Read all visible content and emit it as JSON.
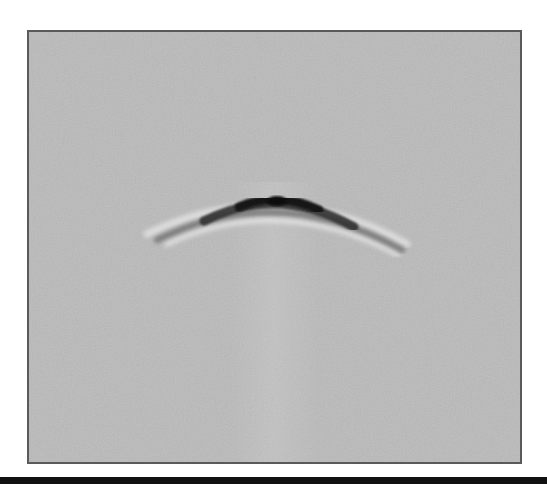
{
  "image": {
    "type": "gpr-bscan",
    "description": "Grayscale radargram showing a single diffraction hyperbola on a noisy gray background",
    "colors": {
      "background_page": "#ffffff",
      "panel_fill": "#c1c1c1",
      "panel_border": "#5a5a5a",
      "hyperbola_core": "#151515",
      "hyperbola_halo": "#e6e6e6",
      "bottom_bar": "#111111"
    },
    "hyperbola": {
      "apex": [
        275,
        200
      ],
      "left_tail": [
        155,
        238
      ],
      "right_tail": [
        400,
        248
      ]
    }
  }
}
